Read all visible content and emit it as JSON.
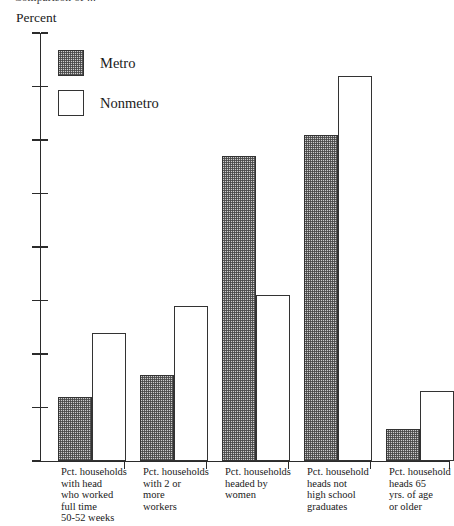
{
  "header": {
    "clipped_caption": "Comparison of ..."
  },
  "axis": {
    "unit_label": "Percent",
    "y_ticks": [
      "80",
      "70",
      "60",
      "50",
      "40",
      "30",
      "20",
      "10",
      "0"
    ]
  },
  "legend": {
    "items": [
      {
        "label": "Metro",
        "swatch": "hatched-swatch",
        "color": "#cdcdcd"
      },
      {
        "label": "Nonmetro",
        "swatch": "white-swatch",
        "color": "#ffffff"
      }
    ]
  },
  "categories_display": [
    "Pct. households\nwith head\nwho worked\nfull time\n50-52 weeks",
    "Pct. households\nwith 2 or\nmore\nworkers",
    "Pct. households\nheaded by\nwomen",
    "Pct. household\nheads not\nhigh school\ngraduates",
    "Pct. household\nheads 65\nyrs. of age\nor older"
  ],
  "chart_data": {
    "type": "bar",
    "title": "",
    "subtitle": "",
    "xlabel": "",
    "ylabel": "Percent",
    "ylim": [
      0,
      80
    ],
    "ytick_step": 10,
    "grid": false,
    "legend_position": "top-left",
    "categories": [
      "Pct. households with head who worked full time 50-52 weeks",
      "Pct. households with 2 or more workers",
      "Pct. households headed by women",
      "Pct. household heads not high school graduates",
      "Pct. household heads 65 yrs. of age or older"
    ],
    "series": [
      {
        "name": "Metro",
        "values": [
          12.0,
          16.0,
          57.0,
          61.0,
          6.0
        ]
      },
      {
        "name": "Nonmetro",
        "values": [
          24.0,
          29.0,
          31.0,
          72.0,
          13.0
        ]
      }
    ]
  }
}
